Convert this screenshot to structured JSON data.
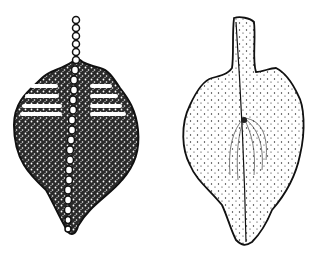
{
  "figure": {
    "background": "#ffffff",
    "ink": "#111111",
    "panels": [
      {
        "id": "left",
        "description": "dorsal view, densely stippled with beaded central ridge and transverse bars near top"
      },
      {
        "id": "right",
        "description": "ventral view, lightly stippled with stalk and longitudinal ridge line"
      }
    ]
  }
}
